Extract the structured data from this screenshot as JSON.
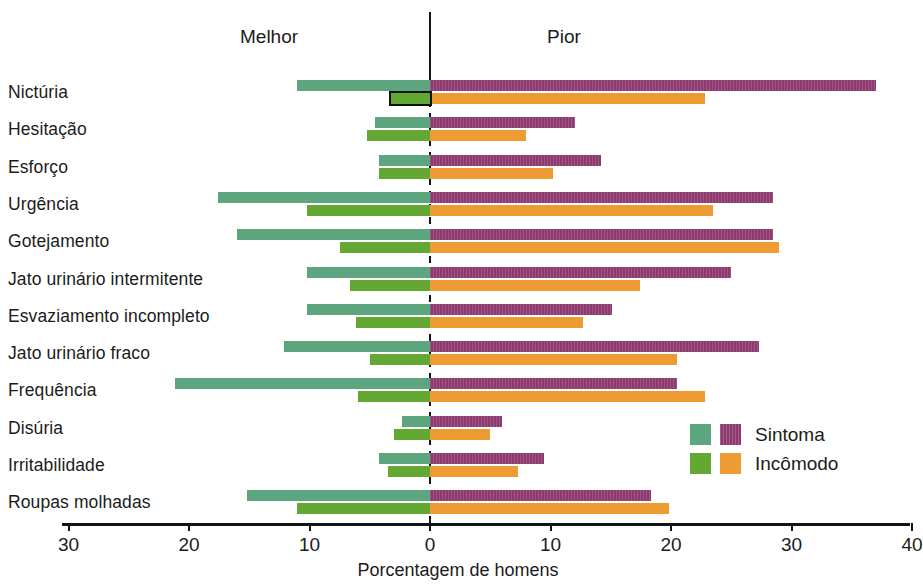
{
  "header": {
    "left_label": "Melhor",
    "right_label": "Pior"
  },
  "axis": {
    "xlabel": "Porcentagem de homens",
    "tick_labels": [
      "30",
      "20",
      "10",
      "0",
      "10",
      "20",
      "30",
      "40"
    ],
    "tick_values": [
      -30,
      -20,
      -10,
      0,
      10,
      20,
      30,
      40
    ],
    "xlim": [
      -32,
      40
    ]
  },
  "legend": {
    "position": "bottom-right",
    "entries": [
      {
        "label": "Sintoma",
        "left_color": "#5da57f",
        "right_color": "#8e3a6e"
      },
      {
        "label": "Incômodo",
        "left_color": "#62a832",
        "right_color": "#ef9b33"
      }
    ]
  },
  "colors": {
    "sintoma_melhor": "#5da57f",
    "sintoma_pior": "#8e3a6e",
    "incomodo_melhor": "#62a832",
    "incomodo_pior": "#ef9b33",
    "axis": "#141414",
    "highlight_outline": "#10100f"
  },
  "chart_data": {
    "type": "bar",
    "orientation": "horizontal",
    "style": "diverging-paired",
    "title": "",
    "xlabel": "Porcentagem de homens",
    "ylabel": "",
    "xlim": [
      -32,
      40
    ],
    "xticks": [
      -30,
      -20,
      -10,
      0,
      10,
      20,
      30,
      40
    ],
    "xticklabels": [
      "30",
      "20",
      "10",
      "0",
      "10",
      "20",
      "30",
      "40"
    ],
    "grid": false,
    "zero_line": true,
    "left_axis_label": "Melhor",
    "right_axis_label": "Pior",
    "categories": [
      "Nictúria",
      "Hesitação",
      "Esforço",
      "Urgência",
      "Gotejamento",
      "Jato urinário intermitente",
      "Esvaziamento incompleto",
      "Jato urinário fraco",
      "Frequência",
      "Disúria",
      "Irritabilidade",
      "Roupas molhadas"
    ],
    "series": [
      {
        "name": "Sintoma",
        "melhor_color": "#5da57f",
        "pior_color": "#8e3a6e",
        "melhor": [
          11.0,
          4.6,
          4.2,
          17.6,
          16.0,
          10.2,
          10.2,
          12.1,
          21.2,
          2.3,
          4.2,
          15.2
        ],
        "pior": [
          37.0,
          12.0,
          14.2,
          28.5,
          28.5,
          25.0,
          15.1,
          27.3,
          20.5,
          6.0,
          9.5,
          18.3
        ]
      },
      {
        "name": "Incômodo",
        "melhor_color": "#62a832",
        "pior_color": "#ef9b33",
        "melhor": [
          3.2,
          5.2,
          4.2,
          10.2,
          7.5,
          6.6,
          6.1,
          5.0,
          6.0,
          3.0,
          3.5,
          11.0
        ],
        "pior": [
          22.8,
          8.0,
          10.2,
          23.5,
          29.0,
          17.4,
          12.7,
          20.5,
          22.8,
          5.0,
          7.3,
          19.8
        ]
      }
    ],
    "highlighted_bar": {
      "category": "Nictúria",
      "series": "Incômodo",
      "side": "melhor",
      "note": "outlined in black"
    }
  }
}
